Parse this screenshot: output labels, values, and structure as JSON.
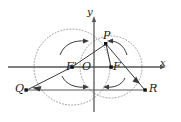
{
  "figure": {
    "kind": "geometry-diagram",
    "background_color": "#ffffff",
    "stroke_color": "#3a3a3a",
    "dotted_circle_color": "#9a9a9a",
    "point_color": "#111111"
  },
  "axes": {
    "x_label": "x",
    "y_label": "y",
    "origin_label": "O",
    "x_axis": {
      "x1": 8,
      "y1": 67,
      "x2": 166,
      "y2": 67
    },
    "y_axis": {
      "x1": 94,
      "y1": 110,
      "x2": 94,
      "y2": 16
    }
  },
  "points": [
    {
      "name": "P",
      "label": "P",
      "x": 106,
      "y": 44
    },
    {
      "name": "F2",
      "label": "F",
      "x": 111,
      "y": 67
    },
    {
      "name": "F1",
      "label": "F'",
      "x": 72,
      "y": 67
    },
    {
      "name": "O",
      "label": "O",
      "x": 94,
      "y": 67
    },
    {
      "name": "Q",
      "label": "Q",
      "x": 26,
      "y": 90
    },
    {
      "name": "R",
      "label": "R",
      "x": 145,
      "y": 90
    }
  ],
  "labels": [
    {
      "id": "label-P",
      "text": "P",
      "left": 103,
      "top": 31
    },
    {
      "id": "label-F2",
      "text": "F",
      "left": 113,
      "top": 62
    },
    {
      "id": "label-F1",
      "text": "F'",
      "left": 68,
      "top": 62
    },
    {
      "id": "label-O",
      "text": "O",
      "left": 83,
      "top": 62
    },
    {
      "id": "label-Q",
      "text": "Q",
      "left": 16,
      "top": 84
    },
    {
      "id": "label-R",
      "text": "R",
      "left": 149,
      "top": 84
    },
    {
      "id": "label-x",
      "text": "x",
      "left": 160,
      "top": 60
    },
    {
      "id": "label-y",
      "text": "y",
      "left": 87,
      "top": 8
    }
  ],
  "circles": [
    {
      "name": "circle-left",
      "cx": 72,
      "cy": 67,
      "r": 38
    },
    {
      "name": "circle-right",
      "cx": 111,
      "cy": 67,
      "r": 31
    }
  ],
  "segments": [
    {
      "name": "segment-F1-P",
      "x1": 72,
      "y1": 67,
      "x2": 106,
      "y2": 44
    },
    {
      "name": "segment-F1-Q",
      "x1": 72,
      "y1": 67,
      "x2": 26,
      "y2": 90
    },
    {
      "name": "segment-P-R",
      "x1": 106,
      "y1": 44,
      "x2": 145,
      "y2": 90
    },
    {
      "name": "segment-Q-R",
      "x1": 26,
      "y1": 90,
      "x2": 145,
      "y2": 90
    },
    {
      "name": "segment-F2-P",
      "x1": 111,
      "y1": 67,
      "x2": 106,
      "y2": 44
    }
  ],
  "arrows": [
    {
      "name": "arrow-upper-left",
      "description": "curved arrow above F' pointing right toward P"
    },
    {
      "name": "arrow-upper-right",
      "description": "curved arrow above F pointing left toward P"
    },
    {
      "name": "arrow-lower-left",
      "description": "curved arrow below F' pointing right toward Q-R line"
    },
    {
      "name": "arrow-lower-right",
      "description": "curved arrow below F pointing left toward Q-R line"
    },
    {
      "name": "arrow-to-Q",
      "description": "arrowhead on segment F' to Q"
    },
    {
      "name": "arrow-to-R",
      "description": "arrowhead on segment P to R"
    }
  ]
}
